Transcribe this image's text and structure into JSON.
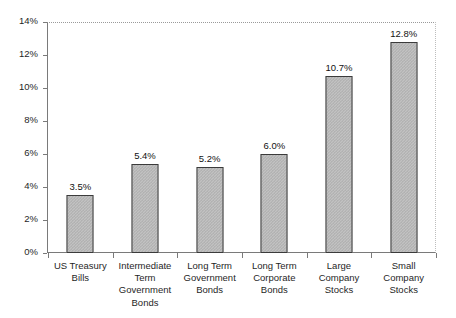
{
  "chart_data": {
    "type": "bar",
    "title": "",
    "subtitle": "",
    "xlabel": "",
    "ylabel": "",
    "categories": [
      "US Treasury Bills",
      "Intermediate Term Government Bonds",
      "Long Term Government Bonds",
      "Long Term Corporate Bonds",
      "Large Company Stocks",
      "Small Company Stocks"
    ],
    "values": [
      3.5,
      5.4,
      5.2,
      6.0,
      10.7,
      12.8
    ],
    "data_labels": [
      "3.5%",
      "5.4%",
      "5.2%",
      "6.0%",
      "10.7%",
      "12.8%"
    ],
    "ylim": [
      0,
      14
    ],
    "ytick_values": [
      0,
      2,
      4,
      6,
      8,
      10,
      12,
      14
    ],
    "ytick_labels": [
      "0%",
      "2%",
      "4%",
      "6%",
      "8%",
      "10%",
      "12%",
      "14%"
    ],
    "grid": false,
    "legend": "none",
    "bar_fill_color": "#c2c2c2",
    "bar_border_color": "#3b3b3b",
    "axis_color": "#7a7a7a",
    "background_color": "#ffffff"
  },
  "axis": {
    "y_labels": [
      "14%",
      "12%",
      "10%",
      "8%",
      "6%",
      "4%",
      "2%",
      "0%"
    ]
  },
  "categories": [
    {
      "lines": [
        "US Treasury",
        "Bills"
      ]
    },
    {
      "lines": [
        "Intermediate",
        "Term",
        "Government",
        "Bonds"
      ]
    },
    {
      "lines": [
        "Long Term",
        "Government",
        "Bonds"
      ]
    },
    {
      "lines": [
        "Long Term",
        "Corporate",
        "Bonds"
      ]
    },
    {
      "lines": [
        "Large",
        "Company",
        "Stocks"
      ]
    },
    {
      "lines": [
        "Small",
        "Company",
        "Stocks"
      ]
    }
  ]
}
